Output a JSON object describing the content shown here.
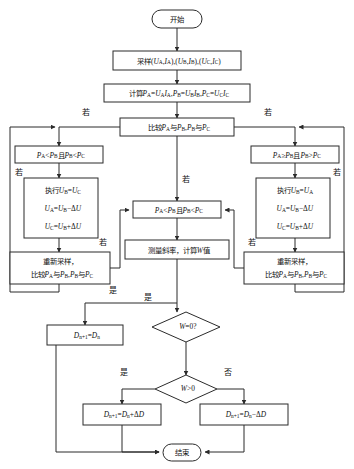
{
  "diagram": {
    "canvas": {
      "width": 354,
      "height": 469,
      "background": "#ffffff"
    },
    "stroke_color": "#2b2b2b",
    "text_color": "#111111"
  },
  "nodes": {
    "start": {
      "label": "开始",
      "shape": "terminator",
      "x": 152,
      "y": 10,
      "w": 50,
      "h": 18
    },
    "sample": {
      "label": "采样(Uₐ,Iₐ),(Uᴮ,Iᴮ),(U꜀,I꜀)",
      "label_plain": "采样(UA,IA),(UB,IB),(UC,IC)",
      "shape": "process",
      "x": 113,
      "y": 51,
      "w": 128,
      "h": 19
    },
    "compute_p": {
      "label_plain": "计算PA=UAIA,PB=UBIB,PC=UCIC",
      "shape": "process",
      "x": 104,
      "y": 84,
      "w": 146,
      "h": 18
    },
    "compare_top": {
      "label_plain": "比较PA与PB,PB与PC",
      "shape": "process",
      "x": 120,
      "y": 118,
      "w": 114,
      "h": 18
    },
    "cond_left": {
      "label_plain": "PA<PB且PB<PC",
      "shape": "process",
      "x": 15,
      "y": 146,
      "w": 88,
      "h": 17
    },
    "cond_right": {
      "label_plain": "PA≥PB且PB>PC",
      "shape": "process",
      "x": 251,
      "y": 146,
      "w": 88,
      "h": 17
    },
    "exec_left": {
      "lines_plain": [
        "执行UB=UC",
        "UA=UB−ΔU",
        "UC=UB+ΔU"
      ],
      "shape": "process",
      "x": 24,
      "y": 178,
      "w": 74,
      "h": 60
    },
    "exec_right": {
      "lines_plain": [
        "执行UB=UA",
        "UA=UB−ΔU",
        "UC=UB+ΔU"
      ],
      "shape": "process",
      "x": 256,
      "y": 178,
      "w": 74,
      "h": 60
    },
    "cond_mid": {
      "label_plain": "PA<PB且PB<PC",
      "shape": "process",
      "x": 133,
      "y": 201,
      "w": 88,
      "h": 17
    },
    "measure_w": {
      "label_plain": "测量斜率，计算W值",
      "shape": "process",
      "x": 125,
      "y": 240,
      "w": 104,
      "h": 19
    },
    "resample_left": {
      "lines_plain": [
        "重新采样，",
        "比较PA与PB,PB与PC"
      ],
      "shape": "process",
      "x": 10,
      "y": 252,
      "w": 100,
      "h": 32
    },
    "resample_right": {
      "lines_plain": [
        "重新采样，",
        "比较PA与PB,PB与PC"
      ],
      "shape": "process",
      "x": 244,
      "y": 252,
      "w": 100,
      "h": 32
    },
    "d_keep": {
      "label_plain": "Dn+1=Dn",
      "shape": "process",
      "x": 47,
      "y": 325,
      "w": 76,
      "h": 20
    },
    "dec_w_zero": {
      "label_plain": "W=0?",
      "shape": "decision",
      "x": 152,
      "y": 312,
      "w": 68,
      "h": 30
    },
    "dec_w_pos": {
      "label_plain": "W>0",
      "shape": "decision",
      "x": 155,
      "y": 375,
      "w": 62,
      "h": 28
    },
    "d_plus": {
      "label_plain": "Dn+1=Dn+ΔD",
      "shape": "process",
      "x": 83,
      "y": 404,
      "w": 78,
      "h": 21
    },
    "d_minus": {
      "label_plain": "Dn+1=Dn−ΔD",
      "shape": "process",
      "x": 200,
      "y": 404,
      "w": 88,
      "h": 21
    },
    "end": {
      "label": "结束",
      "shape": "terminator",
      "x": 163,
      "y": 444,
      "w": 38,
      "h": 17
    }
  },
  "edge_labels": [
    {
      "name": "branch-left-ruo",
      "text": "若",
      "x": 86,
      "y": 113
    },
    {
      "name": "branch-right-ruo",
      "text": "若",
      "x": 268,
      "y": 113
    },
    {
      "name": "branch-mid-ruo",
      "text": "若",
      "x": 186,
      "y": 180
    },
    {
      "name": "loop-left-ruo",
      "text": "若",
      "x": 19,
      "y": 173
    },
    {
      "name": "loop-right-ruo",
      "text": "若",
      "x": 337,
      "y": 173
    },
    {
      "name": "resample-left-ruo",
      "text": "若",
      "x": 103,
      "y": 243
    },
    {
      "name": "resample-right-ruo",
      "text": "若",
      "x": 252,
      "y": 243
    },
    {
      "name": "mid-shi",
      "text": "是",
      "x": 113,
      "y": 291
    },
    {
      "name": "w-zero-shi",
      "text": "是",
      "x": 148,
      "y": 298
    },
    {
      "name": "w-pos-shi",
      "text": "是",
      "x": 124,
      "y": 373
    },
    {
      "name": "w-pos-fou",
      "text": "否",
      "x": 228,
      "y": 373
    }
  ],
  "formulas": {
    "sample": {
      "prefix": "采样(",
      "parts": [
        "U",
        "A",
        ",",
        "I",
        "A",
        "),(",
        "U",
        "B",
        ",",
        "I",
        "B",
        "),(",
        "U",
        "C",
        ",",
        "I",
        "C",
        ")"
      ]
    }
  }
}
